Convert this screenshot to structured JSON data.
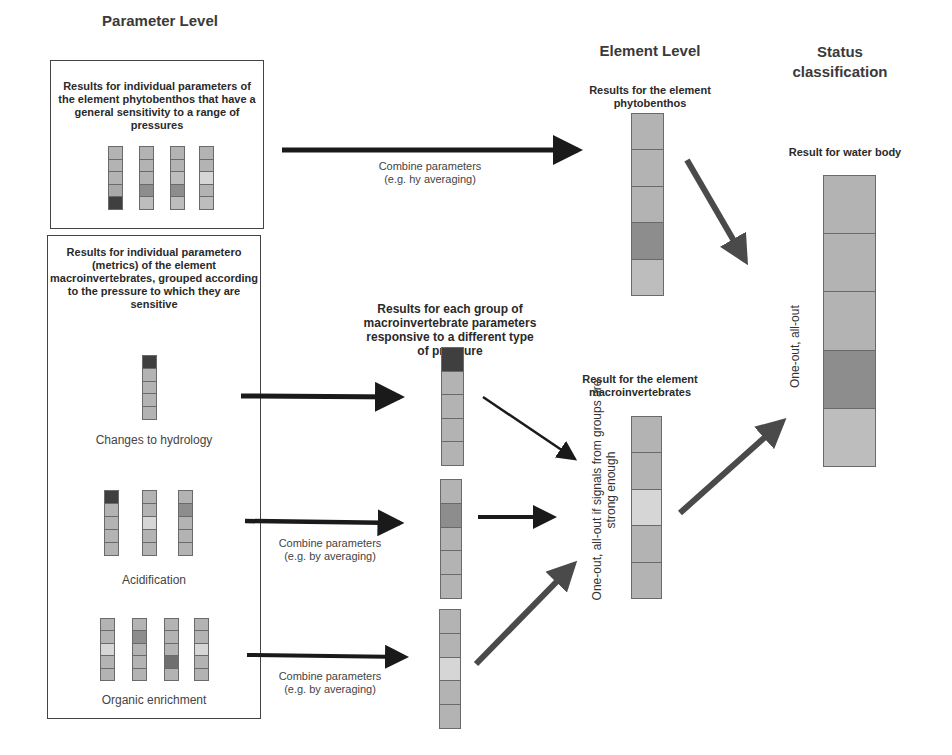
{
  "headings": {
    "parameter_level": "Parameter Level",
    "element_level": "Element Level",
    "status_classification": "Status classification"
  },
  "phyto_panel": {
    "description": "Results for individual parameters of the element phytobenthos that have a general sensitivity to a range of pressures",
    "bars": [
      [
        "#b3b3b3",
        "#b3b3b3",
        "#b3b3b3",
        "#a9a9a9",
        "#3f3f3f"
      ],
      [
        "#b3b3b3",
        "#b3b3b3",
        "#b3b3b3",
        "#8d8d8d",
        "#bdbdbd"
      ],
      [
        "#b3b3b3",
        "#b3b3b3",
        "#bdbdbd",
        "#8d8d8d",
        "#bdbdbd"
      ],
      [
        "#b3b3b3",
        "#b3b3b3",
        "#d6d6d6",
        "#b3b3b3",
        "#bdbdbd"
      ]
    ]
  },
  "macro_panel": {
    "description": "Results for individual parametero (metrics) of the element macroinvertebrates, grouped according to the pressure to which they are sensitive",
    "groups": [
      {
        "label": "Changes to hydrology",
        "bars": [
          [
            "#3f3f3f",
            "#b3b3b3",
            "#b3b3b3",
            "#b3b3b3",
            "#b3b3b3"
          ]
        ]
      },
      {
        "label": "Acidification",
        "bars": [
          [
            "#3f3f3f",
            "#b3b3b3",
            "#b3b3b3",
            "#b3b3b3",
            "#b3b3b3"
          ],
          [
            "#b3b3b3",
            "#b3b3b3",
            "#d6d6d6",
            "#b3b3b3",
            "#b3b3b3"
          ],
          [
            "#b3b3b3",
            "#8d8d8d",
            "#b3b3b3",
            "#b3b3b3",
            "#b3b3b3"
          ]
        ]
      },
      {
        "label": "Organic enrichment",
        "bars": [
          [
            "#b3b3b3",
            "#b3b3b3",
            "#d6d6d6",
            "#b3b3b3",
            "#b3b3b3"
          ],
          [
            "#b3b3b3",
            "#8d8d8d",
            "#b3b3b3",
            "#b3b3b3",
            "#b3b3b3"
          ],
          [
            "#b3b3b3",
            "#b3b3b3",
            "#b3b3b3",
            "#6f6f6f",
            "#b3b3b3"
          ],
          [
            "#b3b3b3",
            "#b3b3b3",
            "#d6d6d6",
            "#b3b3b3",
            "#b3b3b3"
          ]
        ]
      }
    ]
  },
  "arrow_labels": {
    "combine_top_1": "Combine parameters",
    "combine_top_2": "(e.g. hy averaging)",
    "combine_mid_1": "Combine parameters",
    "combine_mid_2": "(e.g. by averaging)",
    "combine_bot_1": "Combine parameters",
    "combine_bot_2": "(e.g. by averaging)"
  },
  "element_phyto": {
    "title": "Results for the element phytobenthos",
    "bar": [
      "#b3b3b3",
      "#b3b3b3",
      "#b3b3b3",
      "#8d8d8d",
      "#bdbdbd"
    ]
  },
  "group_results": {
    "title": "Results for each group of macroinvertebrate parameters responsive to a different type of pressure",
    "bars": [
      [
        "#3f3f3f",
        "#b3b3b3",
        "#b3b3b3",
        "#b3b3b3",
        "#b3b3b3"
      ],
      [
        "#b3b3b3",
        "#8d8d8d",
        "#b3b3b3",
        "#b3b3b3",
        "#b3b3b3"
      ],
      [
        "#b3b3b3",
        "#b3b3b3",
        "#d6d6d6",
        "#b3b3b3",
        "#b3b3b3"
      ]
    ]
  },
  "element_macro": {
    "title": "Result for the element macroinvertebrates",
    "rule": "One-out, all-out if signals from groups are strong enough",
    "bar": [
      "#b3b3b3",
      "#b3b3b3",
      "#d6d6d6",
      "#b3b3b3",
      "#b3b3b3"
    ]
  },
  "water_body": {
    "title": "Result for water body",
    "rule": "One-out, all-out",
    "bar": [
      "#b3b3b3",
      "#b3b3b3",
      "#b3b3b3",
      "#8d8d8d",
      "#bdbdbd"
    ]
  }
}
